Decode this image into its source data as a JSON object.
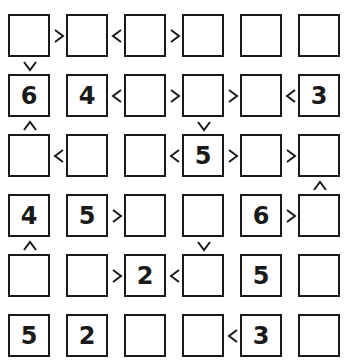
{
  "puzzle": {
    "type": "futoshiki",
    "size": 6,
    "grid": [
      [
        "",
        "",
        "",
        "",
        "",
        ""
      ],
      [
        "6",
        "4",
        "",
        "",
        "",
        "3"
      ],
      [
        "",
        "",
        "",
        "5",
        "",
        ""
      ],
      [
        "4",
        "5",
        "",
        "",
        "6",
        ""
      ],
      [
        "",
        "",
        "2",
        "",
        "5",
        ""
      ],
      [
        "5",
        "2",
        "",
        "",
        "3",
        ""
      ]
    ],
    "horizontal_signs": [
      {
        "row": 0,
        "col": 0,
        "sign": ">"
      },
      {
        "row": 0,
        "col": 1,
        "sign": "<"
      },
      {
        "row": 0,
        "col": 2,
        "sign": ">"
      },
      {
        "row": 1,
        "col": 1,
        "sign": "<"
      },
      {
        "row": 1,
        "col": 2,
        "sign": ">"
      },
      {
        "row": 1,
        "col": 3,
        "sign": ">"
      },
      {
        "row": 1,
        "col": 4,
        "sign": "<"
      },
      {
        "row": 2,
        "col": 0,
        "sign": "<"
      },
      {
        "row": 2,
        "col": 2,
        "sign": "<"
      },
      {
        "row": 2,
        "col": 3,
        "sign": ">"
      },
      {
        "row": 2,
        "col": 4,
        "sign": ">"
      },
      {
        "row": 3,
        "col": 1,
        "sign": ">"
      },
      {
        "row": 3,
        "col": 4,
        "sign": ">"
      },
      {
        "row": 4,
        "col": 1,
        "sign": ">"
      },
      {
        "row": 4,
        "col": 2,
        "sign": "<"
      },
      {
        "row": 5,
        "col": 3,
        "sign": "<"
      }
    ],
    "vertical_signs": [
      {
        "row": 1,
        "col": 0,
        "sign": "v"
      },
      {
        "row": 2,
        "col": 0,
        "sign": "^"
      },
      {
        "row": 2,
        "col": 3,
        "sign": "v"
      },
      {
        "row": 3,
        "col": 5,
        "sign": "^"
      },
      {
        "row": 4,
        "col": 0,
        "sign": "^"
      },
      {
        "row": 4,
        "col": 3,
        "sign": "v"
      }
    ]
  }
}
